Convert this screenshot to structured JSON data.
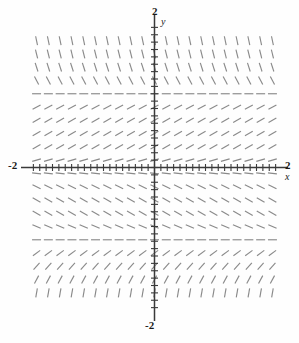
{
  "figure": {
    "kind": "slope-field",
    "background_color": "#fefefe",
    "stroke_color": "#8a8a8a",
    "axis_color": "#3a3a3a"
  },
  "labels": {
    "y_top": "2",
    "y_bottom": "-2",
    "x_left": "-2",
    "x_right": "2",
    "y_var": "y",
    "x_var": "x"
  },
  "chart_data": {
    "type": "scatter",
    "title": "",
    "xlabel": "x",
    "ylabel": "y",
    "xlim": [
      -2,
      2
    ],
    "ylim": [
      -2,
      2
    ],
    "grid": false,
    "legend": null,
    "xticks": [
      -2,
      -1.9,
      -1.8,
      -1.7,
      -1.6,
      -1.5,
      -1.4,
      -1.3,
      -1.2,
      -1.1,
      -1,
      -0.9,
      -0.8,
      -0.7,
      -0.6,
      -0.5,
      -0.4,
      -0.3,
      -0.2,
      -0.1,
      0,
      0.1,
      0.2,
      0.3,
      0.4,
      0.5,
      0.6,
      0.7,
      0.8,
      0.9,
      1,
      1.1,
      1.2,
      1.3,
      1.4,
      1.5,
      1.6,
      1.7,
      1.8,
      1.9,
      2
    ],
    "yticks": [
      -2,
      -1.9,
      -1.8,
      -1.7,
      -1.6,
      -1.5,
      -1.4,
      -1.3,
      -1.2,
      -1.1,
      -1,
      -0.9,
      -0.8,
      -0.7,
      -0.6,
      -0.5,
      -0.4,
      -0.3,
      -0.2,
      -0.1,
      0,
      0.1,
      0.2,
      0.3,
      0.4,
      0.5,
      0.6,
      0.7,
      0.8,
      0.9,
      1,
      1.1,
      1.2,
      1.3,
      1.4,
      1.5,
      1.6,
      1.7,
      1.8,
      1.9,
      2
    ],
    "tick_labels_shown": [
      "-2",
      "2"
    ],
    "grid_columns_x": [
      -1.85,
      -1.665,
      -1.48,
      -1.295,
      -1.11,
      -0.925,
      -0.74,
      -0.555,
      -0.37,
      -0.185,
      0,
      0.185,
      0.37,
      0.555,
      0.74,
      0.925,
      1.11,
      1.295,
      1.48,
      1.665,
      1.85
    ],
    "grid_rows_y": [
      1.72,
      1.54,
      1.36,
      1.18,
      1.0,
      0.82,
      0.64,
      0.46,
      0.28,
      0.1,
      0.0,
      -0.08,
      -0.26,
      -0.44,
      -0.62,
      -0.8,
      -0.98,
      -1.16,
      -1.34,
      -1.52,
      -1.7
    ],
    "row_slope_angles_deg": [
      -78,
      -76,
      -72,
      -62,
      0,
      28,
      30,
      30,
      30,
      16,
      0,
      -6,
      -26,
      -30,
      -30,
      -24,
      0,
      36,
      48,
      62,
      80
    ],
    "note": "Slope depends only on y; zero-slope (horizontal) rows occur near y = 1.0, y = 0.0 and y = -0.98"
  }
}
